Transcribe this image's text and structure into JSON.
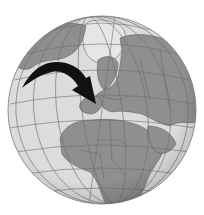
{
  "figure": {
    "colors": {
      "background": "#ffffff",
      "ocean": "#dcdcdc",
      "land": "#8f8f8f",
      "ice": "#e6e6e6",
      "gridlines": "#6e6e6e",
      "borders": "#555555",
      "arrow": "#111111",
      "rim": "#7a7a7a"
    },
    "globe": {
      "cx": 102,
      "cy": 110,
      "r": 94
    },
    "arrow": {
      "from": "North Atlantic",
      "to": "Western Europe"
    }
  }
}
